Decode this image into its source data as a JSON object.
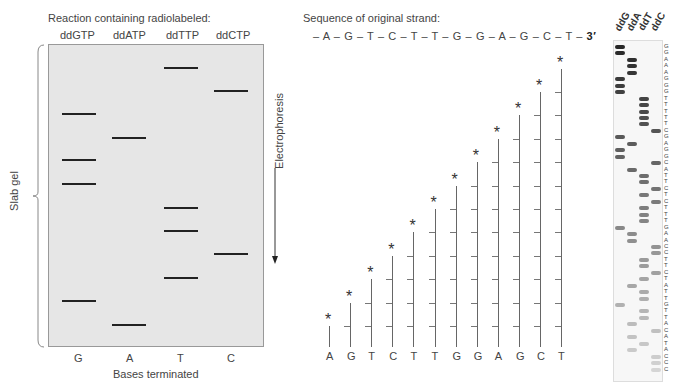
{
  "left_panel": {
    "title": "Reaction containing radiolabeled:",
    "lanes": [
      "ddGTP",
      "ddATP",
      "ddTTP",
      "ddCTP"
    ],
    "bottom_letters": [
      "G",
      "A",
      "T",
      "C"
    ],
    "xlabel": "Bases terminated",
    "side_label": "Slab gel",
    "arrow_label": "Electrophoresis",
    "bands": [
      {
        "lane": "T",
        "y": 68
      },
      {
        "lane": "C",
        "y": 91
      },
      {
        "lane": "G",
        "y": 114
      },
      {
        "lane": "A",
        "y": 138
      },
      {
        "lane": "G",
        "y": 160
      },
      {
        "lane": "G",
        "y": 184
      },
      {
        "lane": "T",
        "y": 208
      },
      {
        "lane": "T",
        "y": 231
      },
      {
        "lane": "C",
        "y": 254
      },
      {
        "lane": "T",
        "y": 278
      },
      {
        "lane": "G",
        "y": 301
      },
      {
        "lane": "A",
        "y": 325
      }
    ]
  },
  "middle_panel": {
    "title": "Sequence of original strand:",
    "sequence_text": "– A – G – T – C – T – T – G – G – A – G – C – T –",
    "three_prime": "3′",
    "fragments": [
      "A",
      "G",
      "T",
      "C",
      "T",
      "T",
      "G",
      "G",
      "A",
      "G",
      "C",
      "T"
    ],
    "marker_icon": "asterisk-icon"
  },
  "right_panel": {
    "lane_headers": [
      "ddG",
      "ddA",
      "ddT",
      "ddC"
    ],
    "read_sequence": [
      "G",
      "G",
      "A",
      "A",
      "A",
      "G",
      "G",
      "G",
      "T",
      "T",
      "T",
      "T",
      "T",
      "C",
      "G",
      "A",
      "G",
      "G",
      "C",
      "A",
      "T",
      "T",
      "C",
      "T",
      "C",
      "T",
      "T",
      "T",
      "G",
      "A",
      "A",
      "C",
      "C",
      "T",
      "T",
      "C",
      "T",
      "A",
      "T",
      "T",
      "G",
      "T",
      "T",
      "A",
      "C",
      "A",
      "T",
      "A",
      "C",
      "C",
      "C"
    ]
  },
  "colors": {
    "gel": "#e6e6e6",
    "band": "#222222",
    "text": "#444444"
  }
}
